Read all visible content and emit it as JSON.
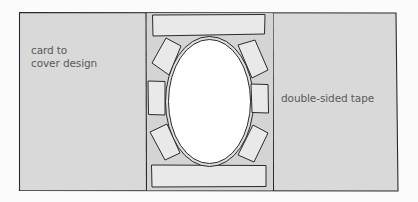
{
  "diagram": {
    "labels": {
      "card": "card to\ncover design",
      "tape": "double-sided tape"
    },
    "colors": {
      "background": "#fbfbfb",
      "card": "#d9d9d9",
      "tape": "#e9e9e9",
      "window": "#ffffff",
      "stroke": "#2a2a2a",
      "text": "#5a5a5a"
    },
    "parts": {
      "tape_pieces_count": 8,
      "window_shape": "oval"
    }
  }
}
